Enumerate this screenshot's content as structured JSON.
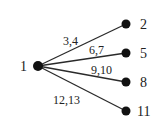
{
  "diagram": {
    "type": "tree",
    "root": {
      "id": "1",
      "label": "1",
      "x": 38,
      "y": 66,
      "label_x": 20,
      "label_y": 71
    },
    "children": [
      {
        "id": "2",
        "label": "2",
        "x": 126,
        "y": 24,
        "label_x": 140,
        "label_y": 29,
        "edge_label": "3,4",
        "edge_label_x": 63,
        "edge_label_y": 45
      },
      {
        "id": "5",
        "label": "5",
        "x": 126,
        "y": 53,
        "label_x": 140,
        "label_y": 58,
        "edge_label": "6,7",
        "edge_label_x": 89,
        "edge_label_y": 54
      },
      {
        "id": "8",
        "label": "8",
        "x": 126,
        "y": 82,
        "label_x": 140,
        "label_y": 87,
        "edge_label": "9,10",
        "edge_label_x": 91,
        "edge_label_y": 74
      },
      {
        "id": "11",
        "label": "11",
        "x": 126,
        "y": 111,
        "label_x": 137,
        "label_y": 116,
        "edge_label": "12,13",
        "edge_label_x": 53,
        "edge_label_y": 104
      }
    ]
  }
}
